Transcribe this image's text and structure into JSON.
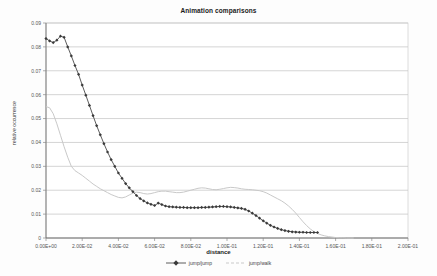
{
  "chart_data": {
    "type": "line",
    "title": "Animation comparisons",
    "xlabel": "distance",
    "ylabel": "relative occurrence",
    "xlim": [
      0,
      0.2
    ],
    "ylim": [
      0,
      0.09
    ],
    "grid": true,
    "legend_position": "bottom",
    "xticks": [
      "0.00E+00",
      "2.00E-02",
      "4.00E-02",
      "6.00E-02",
      "8.00E-02",
      "1.00E-01",
      "1.20E-01",
      "1.40E-01",
      "1.60E-01",
      "1.80E-01",
      "2.00E-01"
    ],
    "xtick_values": [
      0,
      0.02,
      0.04,
      0.06,
      0.08,
      0.1,
      0.12,
      0.14,
      0.16,
      0.18,
      0.2
    ],
    "yticks": [
      "0",
      "0.01",
      "0.02",
      "0.03",
      "0.04",
      "0.05",
      "0.06",
      "0.07",
      "0.08",
      "0.09"
    ],
    "ytick_values": [
      0,
      0.01,
      0.02,
      0.03,
      0.04,
      0.05,
      0.06,
      0.07,
      0.08,
      0.09
    ],
    "series": [
      {
        "name": "jump/jump",
        "color": "#4a4a4a",
        "marker": "diamond",
        "x": [
          0.0,
          0.002,
          0.004,
          0.006,
          0.008,
          0.01,
          0.012,
          0.014,
          0.016,
          0.018,
          0.02,
          0.022,
          0.024,
          0.026,
          0.028,
          0.03,
          0.032,
          0.034,
          0.036,
          0.038,
          0.04,
          0.042,
          0.044,
          0.046,
          0.048,
          0.05,
          0.052,
          0.054,
          0.056,
          0.058,
          0.06,
          0.062,
          0.064,
          0.066,
          0.068,
          0.07,
          0.072,
          0.074,
          0.076,
          0.078,
          0.08,
          0.082,
          0.084,
          0.086,
          0.088,
          0.09,
          0.092,
          0.094,
          0.096,
          0.098,
          0.1,
          0.102,
          0.104,
          0.106,
          0.108,
          0.11,
          0.112,
          0.114,
          0.116,
          0.118,
          0.12,
          0.122,
          0.124,
          0.126,
          0.128,
          0.13,
          0.132,
          0.134,
          0.136,
          0.138,
          0.14,
          0.142,
          0.144,
          0.146,
          0.148,
          0.15
        ],
        "y": [
          0.0835,
          0.0825,
          0.0818,
          0.0828,
          0.0845,
          0.084,
          0.08,
          0.0762,
          0.0722,
          0.0685,
          0.064,
          0.0598,
          0.0555,
          0.0512,
          0.047,
          0.0432,
          0.0395,
          0.036,
          0.0328,
          0.03,
          0.0272,
          0.025,
          0.0228,
          0.021,
          0.0194,
          0.0178,
          0.0165,
          0.0155,
          0.0147,
          0.0141,
          0.0136,
          0.0146,
          0.014,
          0.0134,
          0.0131,
          0.013,
          0.0129,
          0.0128,
          0.0128,
          0.0127,
          0.0127,
          0.0127,
          0.0127,
          0.0128,
          0.0128,
          0.0129,
          0.013,
          0.0131,
          0.0132,
          0.0132,
          0.0131,
          0.013,
          0.0128,
          0.0126,
          0.0124,
          0.012,
          0.0113,
          0.0104,
          0.0094,
          0.0083,
          0.0072,
          0.0062,
          0.0053,
          0.0046,
          0.004,
          0.0035,
          0.0031,
          0.0028,
          0.0026,
          0.0025,
          0.0024,
          0.0024,
          0.0023,
          0.0023,
          0.0023,
          0.0023
        ]
      },
      {
        "name": "jump/walk",
        "color": "#c9c9c9",
        "marker": "none",
        "x": [
          0.0,
          0.002,
          0.004,
          0.006,
          0.008,
          0.01,
          0.012,
          0.014,
          0.016,
          0.018,
          0.02,
          0.022,
          0.024,
          0.026,
          0.028,
          0.03,
          0.032,
          0.034,
          0.036,
          0.038,
          0.04,
          0.042,
          0.044,
          0.046,
          0.048,
          0.05,
          0.052,
          0.054,
          0.056,
          0.058,
          0.06,
          0.062,
          0.064,
          0.066,
          0.068,
          0.07,
          0.072,
          0.074,
          0.076,
          0.078,
          0.08,
          0.082,
          0.084,
          0.086,
          0.088,
          0.09,
          0.092,
          0.094,
          0.096,
          0.098,
          0.1,
          0.102,
          0.104,
          0.106,
          0.108,
          0.11,
          0.112,
          0.114,
          0.116,
          0.118,
          0.12,
          0.122,
          0.124,
          0.126,
          0.128,
          0.13,
          0.132,
          0.134,
          0.136,
          0.138,
          0.14,
          0.142,
          0.144,
          0.146,
          0.148,
          0.15,
          0.152,
          0.154,
          0.156,
          0.158,
          0.16,
          0.162,
          0.164,
          0.166,
          0.168,
          0.17
        ],
        "y": [
          0.055,
          0.0545,
          0.052,
          0.0478,
          0.043,
          0.0382,
          0.0338,
          0.03,
          0.0282,
          0.0272,
          0.0262,
          0.025,
          0.0238,
          0.0226,
          0.0216,
          0.0206,
          0.0198,
          0.019,
          0.0182,
          0.0176,
          0.017,
          0.0168,
          0.0172,
          0.018,
          0.0188,
          0.0192,
          0.019,
          0.0186,
          0.0184,
          0.0186,
          0.019,
          0.0194,
          0.0196,
          0.0196,
          0.0194,
          0.0192,
          0.019,
          0.019,
          0.0192,
          0.0196,
          0.02,
          0.0204,
          0.0208,
          0.021,
          0.0209,
          0.0206,
          0.0203,
          0.0202,
          0.0204,
          0.0207,
          0.021,
          0.0212,
          0.0211,
          0.0209,
          0.0206,
          0.0204,
          0.0203,
          0.0202,
          0.02,
          0.0198,
          0.0194,
          0.0188,
          0.018,
          0.0172,
          0.0164,
          0.0156,
          0.0146,
          0.0134,
          0.012,
          0.0104,
          0.0086,
          0.0068,
          0.0052,
          0.0038,
          0.0027,
          0.0019,
          0.0013,
          0.0009,
          0.0006,
          0.0004,
          0.0002,
          0.0001,
          0.0001,
          0.0,
          0.0,
          0.0
        ]
      }
    ]
  },
  "legend": {
    "items": [
      {
        "label": "jump/jump"
      },
      {
        "label": "jump/walk"
      }
    ]
  }
}
